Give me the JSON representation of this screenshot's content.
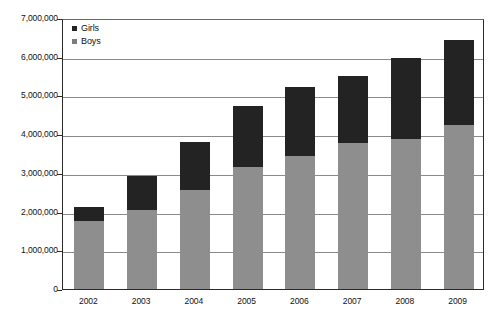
{
  "chart_data": {
    "type": "bar",
    "subtype": "stacked-vertical",
    "title": "",
    "subtitle": "",
    "xlabel": "",
    "ylabel": "",
    "categories": [
      "2002",
      "2003",
      "2004",
      "2005",
      "2006",
      "2007",
      "2008",
      "2009"
    ],
    "series": [
      {
        "name": "Boys",
        "color": "#8e8e8e",
        "values": [
          1760000,
          2040000,
          2570000,
          3160000,
          3440000,
          3770000,
          3880000,
          4240000
        ]
      },
      {
        "name": "Girls",
        "color": "#232323",
        "values": [
          360000,
          890000,
          1240000,
          1580000,
          1790000,
          1720000,
          2080000,
          2190000
        ]
      }
    ],
    "totals": [
      2120000,
      2930000,
      3810000,
      4740000,
      5230000,
      5490000,
      5960000,
      6430000
    ],
    "ylim": [
      0,
      7000000
    ],
    "ytick_values": [
      0,
      1000000,
      2000000,
      3000000,
      4000000,
      5000000,
      6000000,
      7000000
    ],
    "ytick_labels": [
      "0",
      "1,000,000",
      "2,000,000",
      "3,000,000",
      "4,000,000",
      "5,000,000",
      "6,000,000",
      "7,000,000"
    ],
    "grid": true,
    "grid_axis": "y",
    "legend_position": "top-left",
    "legend": [
      "Girls",
      "Boys"
    ]
  },
  "legend": {
    "items": [
      {
        "label": "Girls",
        "swatch": "legend-swatch-girls"
      },
      {
        "label": "Boys",
        "swatch": "legend-swatch-boys"
      }
    ]
  },
  "colors": {
    "girls": "#232323",
    "boys": "#8e8e8e",
    "gridline": "#8a8a8a",
    "axis": "#2b2b2b",
    "background": "#ffffff",
    "text": "#111111"
  }
}
